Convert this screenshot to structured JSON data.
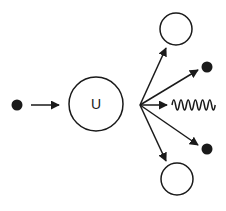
{
  "diagram": {
    "colors": {
      "ink": "#1a1a1a",
      "background": "#ffffff"
    },
    "incoming_neutron": {
      "cx": 17,
      "cy": 105,
      "r": 5.5
    },
    "incoming_arrow": {
      "x1": 31,
      "y1": 105,
      "x2": 59,
      "y2": 105
    },
    "nucleus": {
      "cx": 96,
      "cy": 104,
      "r": 27,
      "label": "U"
    },
    "fan_origin": {
      "x": 140,
      "y": 105
    },
    "products": {
      "fragment_top": {
        "cx": 176,
        "cy": 29,
        "r": 16,
        "arrow_tip": {
          "x": 166,
          "y": 48
        }
      },
      "neutron_top": {
        "cx": 207,
        "cy": 67,
        "r": 5.5,
        "arrow_tip": {
          "x": 198,
          "y": 70
        }
      },
      "radiation": {
        "arrow_tip": {
          "x": 167,
          "y": 105
        },
        "wave_x1": 172,
        "wave_x2": 215,
        "wave_y": 105,
        "peaks": 6,
        "amplitude": 5
      },
      "neutron_bottom": {
        "cx": 207,
        "cy": 149,
        "r": 5.5,
        "arrow_tip": {
          "x": 198,
          "y": 145
        }
      },
      "fragment_bottom": {
        "cx": 177,
        "cy": 179,
        "r": 16,
        "arrow_tip": {
          "x": 166,
          "y": 161
        }
      }
    }
  }
}
